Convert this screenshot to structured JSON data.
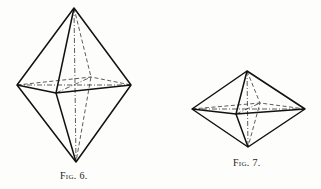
{
  "figures": [
    {
      "id": "fig6",
      "caption": "Fig. 6.",
      "description": "Elongated bipyramid (octahedron) drawn in perspective; solid outer edges, dashed hidden edges, dash-dot axes",
      "vertices": {
        "top": [
          74,
          8
        ],
        "bottom": [
          76,
          162
        ],
        "left": [
          17,
          85
        ],
        "right": [
          131,
          85
        ],
        "front": [
          56,
          93
        ],
        "back": [
          91,
          77
        ],
        "center": [
          75,
          85
        ]
      }
    },
    {
      "id": "fig7",
      "caption": "Fig. 7.",
      "description": "Flattened bipyramid (octahedron) drawn in perspective; solid outer edges, dashed hidden edges, dash-dot axes",
      "vertices": {
        "top": [
          247,
          71
        ],
        "bottom": [
          248,
          147
        ],
        "left": [
          192,
          109
        ],
        "right": [
          305,
          109
        ],
        "front": [
          236,
          114
        ],
        "back": [
          260,
          103
        ],
        "center": [
          248,
          109
        ]
      }
    }
  ],
  "colors": {
    "line": "#111111",
    "background": "#fdfdfb"
  }
}
